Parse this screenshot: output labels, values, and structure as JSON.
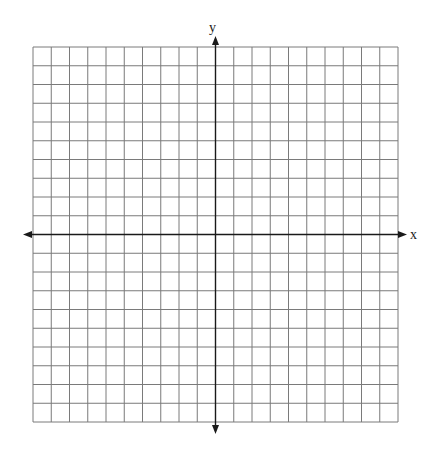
{
  "graph": {
    "x_axis_label": "x",
    "y_axis_label": "y",
    "columns": 20,
    "rows": 20,
    "grid_color": "#7a7a7a",
    "axis_color": "#1a1a1a",
    "grid_bounds": {
      "left": 33,
      "top": 47,
      "right": 398,
      "bottom": 422
    }
  }
}
